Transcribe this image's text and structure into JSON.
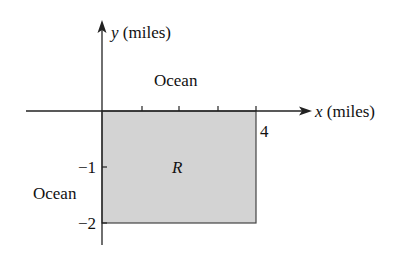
{
  "diagram": {
    "axes": {
      "x_var": "x",
      "x_unit": "(miles)",
      "y_var": "y",
      "y_unit": "(miles)"
    },
    "ticks": {
      "x_label_4": "4",
      "y_label_neg1": "−1",
      "y_label_neg2": "−2"
    },
    "labels": {
      "ocean_top": "Ocean",
      "ocean_left": "Ocean",
      "region": "R"
    },
    "region": {
      "x_range": [
        0,
        4
      ],
      "y_range": [
        -2,
        0
      ],
      "fill_color": "#d3d3d3",
      "stroke_color": "#333333"
    }
  }
}
